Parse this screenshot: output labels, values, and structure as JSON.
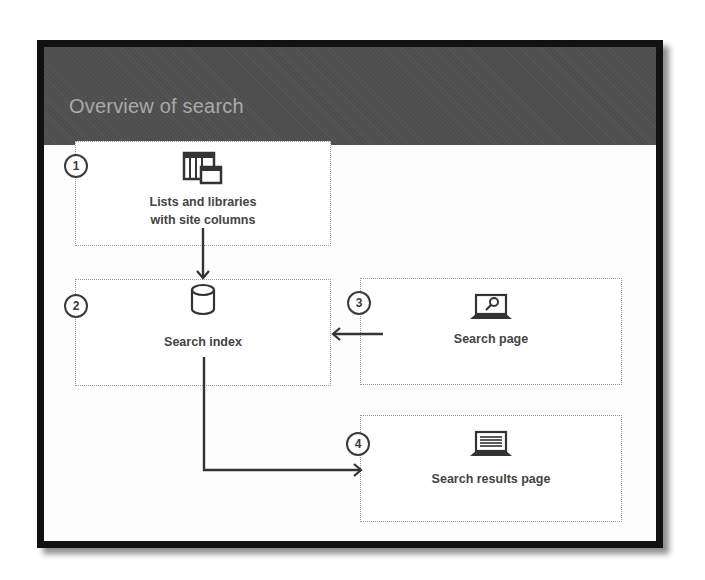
{
  "slide": {
    "title": "Overview of search"
  },
  "steps": [
    {
      "number": "1",
      "label_line1": "Lists and libraries",
      "label_line2": "with site columns",
      "icon": "list-library-icon"
    },
    {
      "number": "2",
      "label": "Search index",
      "icon": "database-cylinder-icon"
    },
    {
      "number": "3",
      "label": "Search page",
      "icon": "laptop-search-icon"
    },
    {
      "number": "4",
      "label": "Search results page",
      "icon": "laptop-results-icon"
    }
  ],
  "connectors": [
    {
      "from": "1",
      "to": "2",
      "direction": "down"
    },
    {
      "from": "3",
      "to": "2",
      "direction": "left"
    },
    {
      "from": "2",
      "to": "4",
      "direction": "down-then-right"
    }
  ],
  "colors": {
    "header_bg": "#4e4e4e",
    "title_text": "#a9a9a9",
    "frame": "#111111",
    "box_border": "#9a9a9a",
    "label_text": "#444444",
    "arrow": "#333333"
  }
}
